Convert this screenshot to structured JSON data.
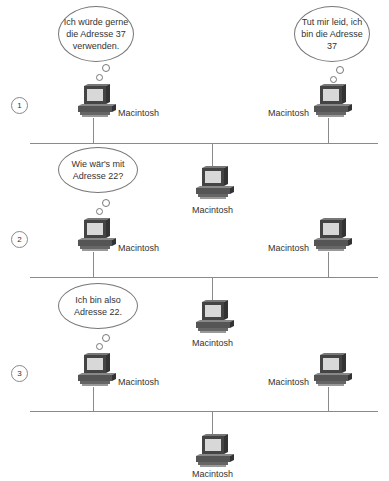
{
  "steps": [
    {
      "number": "1",
      "bubbles": [
        {
          "text": "Ich würde gerne die Adresse 37 verwenden."
        },
        {
          "text": "Tut mir leid, ich bin die Adresse 37"
        }
      ]
    },
    {
      "number": "2",
      "bubbles": [
        {
          "text": "Wie wär's mit Adresse 22?"
        }
      ]
    },
    {
      "number": "3",
      "bubbles": [
        {
          "text": "Ich bin also Adresse 22."
        }
      ]
    }
  ],
  "node_label": "Macintosh",
  "colors": {
    "line": "#8a8a8a",
    "screen": "#d8d8d8",
    "case": "#555555"
  }
}
